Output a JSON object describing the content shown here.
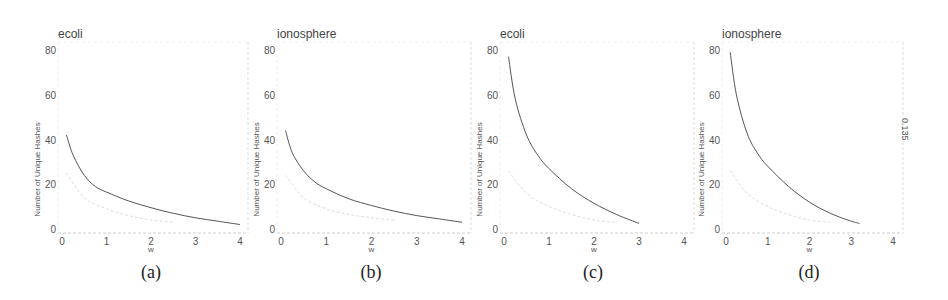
{
  "figure": {
    "captions": [
      "(a)",
      "(b)",
      "(c)",
      "(d)"
    ],
    "side_label": "0.135"
  },
  "chart_data": [
    {
      "type": "line",
      "title": "ecoli",
      "xlabel": "w",
      "ylabel": "Number of Unique Hashes",
      "xlim": [
        0,
        4
      ],
      "ylim": [
        0,
        80
      ],
      "xticks": [
        0,
        1,
        2,
        3,
        4
      ],
      "yticks": [
        0,
        20,
        40,
        60,
        80
      ],
      "grid": false,
      "series": [
        {
          "name": "main",
          "color": "#555555",
          "x": [
            0.1,
            0.25,
            0.5,
            0.75,
            1,
            1.5,
            2,
            2.5,
            3,
            3.5,
            4
          ],
          "y": [
            42,
            33,
            24,
            19,
            16.5,
            12.5,
            9.5,
            7,
            5,
            3.5,
            2
          ]
        },
        {
          "name": "secondary",
          "color": "#dddddd",
          "x": [
            0.1,
            0.5,
            1,
            1.5,
            2,
            2.5
          ],
          "y": [
            25,
            14,
            9,
            6,
            4,
            3
          ]
        }
      ],
      "caption": "(a)"
    },
    {
      "type": "line",
      "title": "ionosphere",
      "xlabel": "w",
      "ylabel": "Number of Unique Hashes",
      "xlim": [
        0,
        4
      ],
      "ylim": [
        0,
        80
      ],
      "xticks": [
        0,
        1,
        2,
        3,
        4
      ],
      "yticks": [
        0,
        20,
        40,
        60,
        80
      ],
      "grid": false,
      "series": [
        {
          "name": "main",
          "color": "#555555",
          "x": [
            0.1,
            0.25,
            0.5,
            0.75,
            1,
            1.5,
            2,
            2.5,
            3,
            3.5,
            4
          ],
          "y": [
            44,
            34,
            26,
            21,
            18,
            13.5,
            10.5,
            8,
            6,
            4.5,
            3
          ]
        },
        {
          "name": "secondary",
          "color": "#dddddd",
          "x": [
            0.1,
            0.5,
            1,
            1.5,
            2,
            2.5
          ],
          "y": [
            24,
            14,
            9,
            6.5,
            5,
            4
          ]
        }
      ],
      "caption": "(b)"
    },
    {
      "type": "line",
      "title": "ecoli",
      "xlabel": "w",
      "ylabel": "Number of Unique Hashes",
      "xlim": [
        0,
        4
      ],
      "ylim": [
        0,
        80
      ],
      "xticks": [
        0,
        1,
        2,
        3,
        4
      ],
      "yticks": [
        0,
        20,
        40,
        60,
        80
      ],
      "grid": false,
      "series": [
        {
          "name": "main",
          "color": "#555555",
          "x": [
            0.1,
            0.25,
            0.5,
            0.75,
            1,
            1.5,
            2,
            2.5,
            3
          ],
          "y": [
            77,
            58,
            42,
            33,
            27,
            18,
            11.5,
            6.5,
            2.5
          ]
        },
        {
          "name": "secondary",
          "color": "#dddddd",
          "x": [
            0.1,
            0.5,
            1,
            1.5,
            2,
            2.5
          ],
          "y": [
            26,
            16,
            10,
            6.5,
            4,
            3
          ]
        }
      ],
      "caption": "(c)"
    },
    {
      "type": "line",
      "title": "ionosphere",
      "xlabel": "w",
      "ylabel": "Number of Unique Hashes",
      "xlim": [
        0,
        4
      ],
      "ylim": [
        0,
        80
      ],
      "xticks": [
        0,
        1,
        2,
        3,
        4
      ],
      "yticks": [
        0,
        20,
        40,
        60,
        80
      ],
      "grid": false,
      "series": [
        {
          "name": "main",
          "color": "#555555",
          "x": [
            0.1,
            0.25,
            0.5,
            0.75,
            1,
            1.5,
            2,
            2.5,
            3,
            3.2
          ],
          "y": [
            79,
            60,
            43,
            34,
            28,
            19,
            12,
            7,
            3.5,
            2.5
          ]
        },
        {
          "name": "secondary",
          "color": "#dddddd",
          "x": [
            0.1,
            0.5,
            1,
            1.5,
            2,
            2.5
          ],
          "y": [
            26,
            16,
            10,
            6.5,
            4,
            3
          ]
        }
      ],
      "caption": "(d)"
    }
  ],
  "layout": {
    "panels": [
      {
        "x0": 62,
        "x4": 240,
        "right": 248,
        "title_x": 58
      },
      {
        "x0": 281,
        "x4": 462,
        "right": 471,
        "title_x": 277
      },
      {
        "x0": 504,
        "x4": 684,
        "right": 694,
        "title_x": 500
      },
      {
        "x0": 726,
        "x4": 893,
        "right": 903,
        "title_x": 722
      }
    ],
    "y80": 50,
    "y0": 229,
    "axis_y": 233,
    "plot_top": 42
  }
}
